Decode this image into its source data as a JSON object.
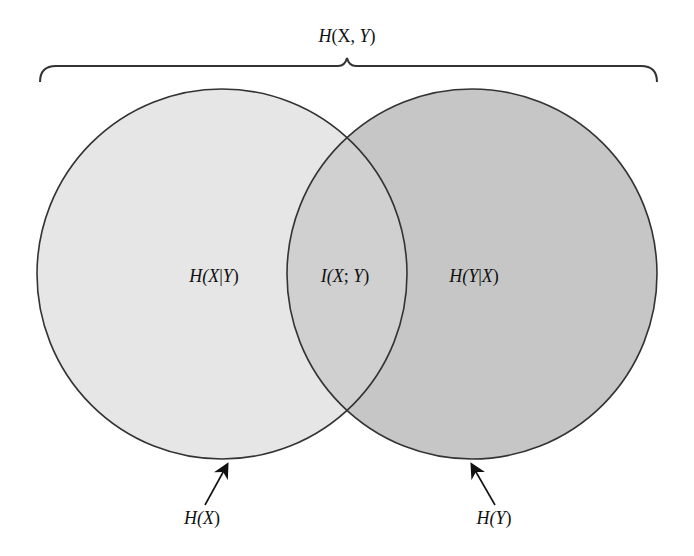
{
  "diagram": {
    "type": "venn",
    "title_label": "H(X, Y)",
    "regions": [
      {
        "id": "h_x_given_y",
        "label_parts": [
          "H(",
          "X",
          "|",
          "Y",
          ")"
        ]
      },
      {
        "id": "mutual_info",
        "label_parts": [
          "I(",
          "X",
          "; ",
          "Y",
          ")"
        ]
      },
      {
        "id": "h_y_given_x",
        "label_parts": [
          "H(",
          "Y",
          "|",
          "X",
          ")"
        ]
      }
    ],
    "circles": [
      {
        "id": "hx",
        "label_parts": [
          "H(",
          "X",
          ")"
        ],
        "fill": "#e6e6e6"
      },
      {
        "id": "hy",
        "label_parts": [
          "H(",
          "Y",
          ")"
        ],
        "fill": "#c6c6c6"
      }
    ],
    "overlap_fill": "#d0d0d0",
    "stroke": "#333333"
  }
}
